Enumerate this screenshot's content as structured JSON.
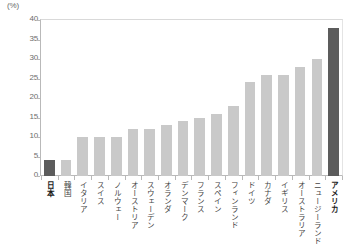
{
  "chart_data": {
    "type": "bar",
    "title": "",
    "xlabel": "",
    "ylabel": "",
    "unit_label": "(%)",
    "ylim": [
      0,
      40
    ],
    "yticks": [
      0,
      5,
      10,
      15,
      20,
      25,
      30,
      35,
      40
    ],
    "grid": false,
    "legend": "none",
    "categories": [
      "日本",
      "韓国",
      "イタリア",
      "スイス",
      "ノルウェー",
      "オーストリア",
      "スウェーデン",
      "オランダ",
      "デンマーク",
      "フランス",
      "スペイン",
      "フィンランド",
      "ドイツ",
      "カナダ",
      "イギリス",
      "オーストラリア",
      "ニュージーランド",
      "アメリカ"
    ],
    "values": [
      4,
      4,
      10,
      10,
      10,
      12,
      12,
      13,
      14,
      15,
      16,
      18,
      24,
      26,
      26,
      28,
      30,
      38
    ],
    "highlighted": [
      "日本",
      "アメリカ"
    ],
    "colors": {
      "bar": "#c9c9c9",
      "bar_highlight": "#5c5c5c",
      "axis": "#b9b9b9",
      "text": "#6b6b6b"
    }
  }
}
